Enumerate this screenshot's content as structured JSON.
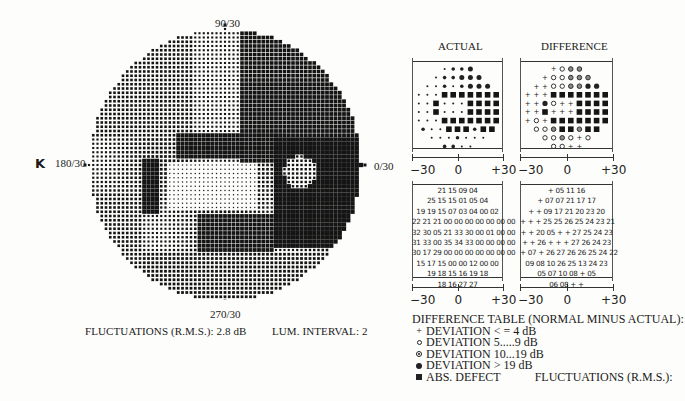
{
  "chart_data": {
    "type": "heatmap",
    "eye_label": "K",
    "meridian_labels": {
      "top": "90/30",
      "bottom": "270/30",
      "left": "180/30",
      "right": "0/30"
    },
    "footer": {
      "fluctuations": "FLUCTUATIONS (R.M.S.): 2.8 dB",
      "lum_interval": "LUM. INTERVAL: 2"
    },
    "panels": {
      "actual_title": "ACTUAL",
      "difference_title": "DIFFERENCE",
      "x_ticks": [
        "−30",
        "0",
        "+30"
      ],
      "x_range": [
        -30,
        30
      ],
      "actual_symbols": [
        [
          "s",
          "m",
          "m",
          "L"
        ],
        [
          "s",
          "m",
          "m",
          "L",
          "L",
          "L"
        ],
        [
          "s",
          "s",
          "m",
          "s",
          "m",
          "L",
          "L",
          "L"
        ],
        [
          "s",
          "s",
          "s",
          "S",
          "S",
          "S",
          "S",
          "S",
          "S",
          "S"
        ],
        [
          "s",
          "s",
          "S",
          "s",
          "s",
          "s",
          "S",
          "S",
          "S",
          "S"
        ],
        [
          "s",
          "s",
          "S",
          "s",
          "s",
          "s",
          "S",
          "S",
          "S",
          "S"
        ],
        [
          "s",
          "s",
          "s",
          "S",
          "S",
          "S",
          "S",
          "S",
          "S",
          "S"
        ],
        [
          "m",
          "s",
          "s",
          "S",
          "S",
          "S",
          "m",
          "S",
          "S"
        ],
        [
          "s",
          "s",
          "s",
          "m",
          "s",
          "s",
          "s"
        ],
        [
          "m",
          "m",
          "s",
          "s"
        ]
      ],
      "difference_symbols": [
        [
          "+",
          "o",
          "h",
          "h"
        ],
        [
          "+",
          "o",
          "o",
          "h",
          "h",
          "h"
        ],
        [
          "+",
          "+",
          "o",
          "o",
          "h",
          "h",
          "F",
          "F"
        ],
        [
          "+",
          "+",
          "+",
          "S",
          "S",
          "S",
          "S",
          "S",
          "S",
          "S"
        ],
        [
          "+",
          "+",
          "F",
          "o",
          "+",
          "+",
          "S",
          "S",
          "S",
          "S"
        ],
        [
          "+",
          "+",
          "S",
          "+",
          "+",
          "+",
          "S",
          "S",
          "S",
          "S"
        ],
        [
          "+",
          "o",
          "+",
          "S",
          "S",
          "S",
          "S",
          "S",
          "S",
          "S"
        ],
        [
          "o",
          "o",
          "h",
          "S",
          "S",
          "h",
          "S",
          "S"
        ],
        [
          "o",
          "o",
          "h",
          "o",
          "+",
          "o"
        ],
        [
          "o",
          "o",
          "+",
          "+"
        ]
      ],
      "actual_values": [
        [
          "21",
          "15",
          "09",
          "04"
        ],
        [
          "25",
          "15",
          "15",
          "01",
          "05",
          "04"
        ],
        [
          "19",
          "19",
          "15",
          "07",
          "03",
          "04",
          "00",
          "02"
        ],
        [
          "22",
          "21",
          "21",
          "00",
          "00",
          "00",
          "00",
          "00",
          "00",
          "00"
        ],
        [
          "32",
          "30",
          "05",
          "21",
          "33",
          "30",
          "00",
          "01",
          "00",
          "00"
        ],
        [
          "31",
          "33",
          "00",
          "35",
          "34",
          "33",
          "00",
          "00",
          "00",
          "00"
        ],
        [
          "30",
          "17",
          "29",
          "00",
          "00",
          "00",
          "00",
          "00",
          "00",
          "00"
        ],
        [
          "15",
          "17",
          "15",
          "00",
          "00",
          "12",
          "00",
          "00"
        ],
        [
          "19",
          "18",
          "15",
          "16",
          "19",
          "18"
        ],
        [
          "18",
          "16",
          "27",
          "27"
        ]
      ],
      "difference_values": [
        [
          "+",
          "05",
          "11",
          "16"
        ],
        [
          "+",
          "07",
          "07",
          "21",
          "17",
          "17"
        ],
        [
          "+",
          "+",
          "09",
          "17",
          "21",
          "20",
          "23",
          "20"
        ],
        [
          "+",
          "+",
          "+",
          "25",
          "25",
          "26",
          "25",
          "24",
          "23",
          "21"
        ],
        [
          "+",
          "+",
          "20",
          "05",
          "+",
          "+",
          "27",
          "25",
          "24",
          "23"
        ],
        [
          "+",
          "+",
          "26",
          "+",
          "+",
          "+",
          "27",
          "26",
          "24",
          "23"
        ],
        [
          "+",
          "07",
          "+",
          "26",
          "27",
          "26",
          "26",
          "25",
          "24",
          "22"
        ],
        [
          "09",
          "08",
          "10",
          "26",
          "25",
          "13",
          "24",
          "23"
        ],
        [
          "05",
          "07",
          "10",
          "08",
          "+",
          "05"
        ],
        [
          "06",
          "08",
          "+",
          "+"
        ]
      ]
    },
    "legend": {
      "title": "DIFFERENCE TABLE (NORMAL MINUS ACTUAL):",
      "items": [
        {
          "symbol": "plus",
          "label": "DEVIATION < = 4 dB"
        },
        {
          "symbol": "open-circle",
          "label": "DEVIATION 5.....9 dB"
        },
        {
          "symbol": "half-circle",
          "label": "DEVIATION 10...19 dB"
        },
        {
          "symbol": "filled-circle",
          "label": "DEVIATION > 19 dB"
        },
        {
          "symbol": "filled-square",
          "label": "ABS. DEFECT"
        }
      ],
      "fluctuations_label": "FLUCTUATIONS (R.M.S.):"
    },
    "colors": {
      "ink": "#151515",
      "paper": "#fdfdfb"
    }
  }
}
